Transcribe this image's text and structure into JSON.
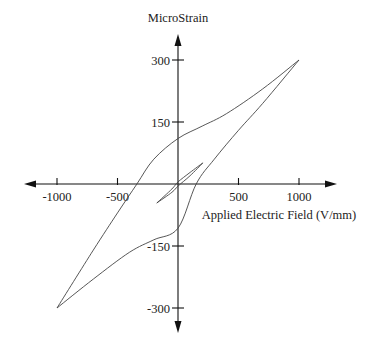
{
  "chart_data": {
    "type": "line",
    "title": "",
    "xlabel": "Applied Electric Field (V/mm)",
    "ylabel": "MicroStrain",
    "xlim": [
      -1250,
      1300
    ],
    "ylim": [
      -360,
      360
    ],
    "x_ticks": [
      -1000,
      -500,
      500,
      1000
    ],
    "x_tick_labels": [
      "-1000",
      "-500",
      "500",
      "1000"
    ],
    "y_ticks": [
      300,
      150,
      -150,
      -300
    ],
    "y_tick_labels": [
      "300",
      "150",
      "-150",
      "-300"
    ],
    "grid": false,
    "legend": null,
    "axes_style": "centered-cross-with-arrows",
    "series": [
      {
        "name": "major-loop-descending",
        "x": [
          1000,
          700,
          400,
          200,
          0,
          -200,
          -340,
          -500,
          -700,
          -1000
        ],
        "y": [
          300,
          230,
          170,
          140,
          110,
          60,
          0,
          -70,
          -160,
          -300
        ]
      },
      {
        "name": "major-loop-ascending",
        "x": [
          -1000,
          -700,
          -400,
          -200,
          0,
          150,
          300,
          500,
          700,
          1000
        ],
        "y": [
          -300,
          -230,
          -165,
          -135,
          -107,
          0,
          60,
          130,
          195,
          300
        ]
      },
      {
        "name": "minor-loop-upper",
        "x": [
          -175,
          -50,
          0,
          100,
          205
        ],
        "y": [
          -46,
          -12,
          5,
          28,
          51
        ]
      },
      {
        "name": "minor-loop-lower",
        "x": [
          -175,
          -50,
          0,
          100,
          205
        ],
        "y": [
          -46,
          -20,
          -5,
          20,
          51
        ]
      }
    ]
  },
  "labels": {
    "ylabel": "MicroStrain",
    "xlabel": "Applied Electric Field (V/mm)",
    "xticks": [
      "-1000",
      "-500",
      "500",
      "1000"
    ],
    "yticks": [
      "300",
      "150",
      "-150",
      "-300"
    ]
  }
}
